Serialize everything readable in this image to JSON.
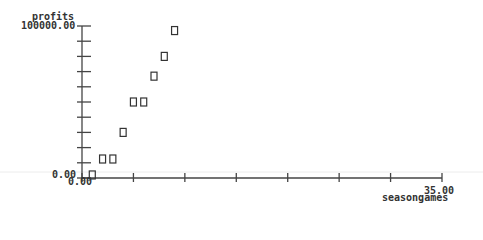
{
  "chart_data": {
    "type": "scatter",
    "title": "",
    "xlabel": "seasongames",
    "ylabel": "profits",
    "xlim": [
      0,
      35
    ],
    "ylim": [
      0,
      100000
    ],
    "x_tick_labels": {
      "min": "0.00",
      "max": "35.00"
    },
    "y_tick_labels": {
      "min": "0.00",
      "max": "100000.00"
    },
    "x_ticks": [
      0,
      5,
      10,
      15,
      20,
      25,
      30,
      35
    ],
    "y_ticks": [
      0,
      10000,
      20000,
      30000,
      40000,
      50000,
      60000,
      70000,
      80000,
      90000,
      100000
    ],
    "grid": false,
    "legend": null,
    "marker": "hollow-square",
    "points": [
      {
        "x": 1,
        "y": 2000
      },
      {
        "x": 2,
        "y": 12500
      },
      {
        "x": 3,
        "y": 12500
      },
      {
        "x": 4,
        "y": 30000
      },
      {
        "x": 5,
        "y": 50000
      },
      {
        "x": 6,
        "y": 50000
      },
      {
        "x": 7,
        "y": 67000
      },
      {
        "x": 8,
        "y": 80000
      },
      {
        "x": 9,
        "y": 97000
      }
    ]
  },
  "labels": {
    "ylabel": "profits",
    "ymax": "100000.00",
    "ymin": "0.00",
    "xmin": "0.00",
    "xmax": "35.00",
    "xlabel": "seasongames"
  },
  "colors": {
    "axis": "#444444",
    "marker": "#333333",
    "faint_line": "#e6e6e6"
  }
}
